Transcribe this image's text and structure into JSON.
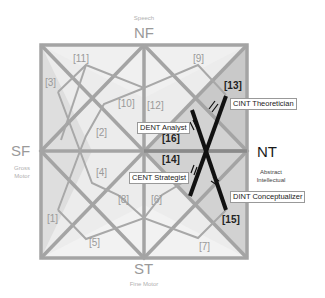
{
  "axes": {
    "top": {
      "code": "NF",
      "caption": "Speech"
    },
    "left": {
      "code": "SF",
      "caption_line1": "Gross",
      "caption_line2": "Motor"
    },
    "right": {
      "code": "NT",
      "caption_line1": "Abstract",
      "caption_line2": "Intellectual"
    },
    "bottom": {
      "code": "ST",
      "caption": "Fine Motor"
    }
  },
  "regions": {
    "r1": "[1]",
    "r2": "[2]",
    "r3": "[3]",
    "r4": "[4]",
    "r5": "[5]",
    "r6": "[6]",
    "r7": "[7]",
    "r8": "[8]",
    "r9": "[9]",
    "r10": "[10]",
    "r11": "[11]",
    "r12": "[12]",
    "r13": "[13]",
    "r14": "[14]",
    "r15": "[15]",
    "r16": "[16]"
  },
  "callouts": {
    "cint": "CINT Theoretician",
    "dent": "DENT Analyst",
    "cent": "CENT Strategist",
    "dint": "DINT Conceptualizer"
  },
  "colors": {
    "frame": "#a0a0a0",
    "fill_light": "#ececec",
    "fill_mid": "#dcdcdc",
    "fill_dark": "#c8c8c8",
    "highlight": "#111111"
  }
}
